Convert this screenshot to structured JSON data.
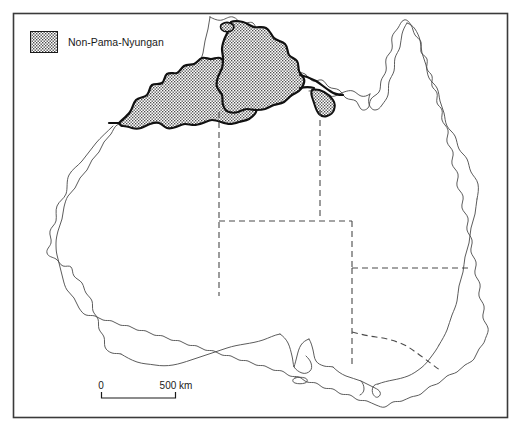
{
  "figure": {
    "kind": "thematic-map",
    "region": "Australia",
    "frame": {
      "x": 13,
      "y": 13,
      "width": 495,
      "height": 405,
      "border_color": "#3a3a3a"
    },
    "background_color": "#ffffff"
  },
  "legend": {
    "items": [
      {
        "label": "Non-Pama-Nyungan",
        "pattern": "dotted-stipple",
        "swatch_fill": "#d9d9d9",
        "swatch_outline": "#1a1a1a"
      }
    ]
  },
  "scale_bar": {
    "start_label": "0",
    "end_label": "500 km",
    "unit": "km",
    "length_value": 500,
    "line_color": "#1a1a1a"
  },
  "map_layers": {
    "coastline": {
      "color": "#4a4a4a",
      "stroke_width": 0.9
    },
    "state_borders": {
      "color": "#4a4a4a",
      "stroke_width": 1.1,
      "style": "dashed"
    },
    "non_pama_nyungan_boundary": {
      "color": "#111111",
      "stroke_width": 2.2
    },
    "non_pama_nyungan_fill": "#dddddd"
  }
}
